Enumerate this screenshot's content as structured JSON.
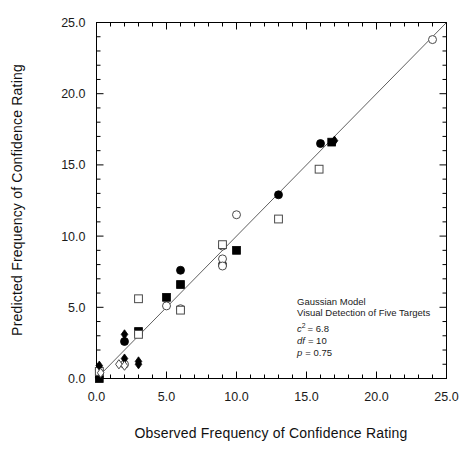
{
  "chart_data": {
    "type": "scatter",
    "title": "",
    "xlabel": "Observed Frequency of Confidence Rating",
    "ylabel": "Predicted Frequency of Confidence Rating",
    "xlim": [
      0,
      25
    ],
    "ylim": [
      0,
      25
    ],
    "xticks": [
      0,
      5,
      10,
      15,
      20,
      25
    ],
    "yticks": [
      0,
      5,
      10,
      15,
      20,
      25
    ],
    "xticklabels": [
      "0.0",
      "5.0",
      "10.0",
      "15.0",
      "20.0",
      "25.0"
    ],
    "yticklabels": [
      "0.0",
      "5.0",
      "10.0",
      "15.0",
      "20.0",
      "25.0"
    ],
    "minor_ticks_per_interval": 5,
    "grid": false,
    "legend": "none",
    "reference_line": {
      "name": "identity-line",
      "type": "line",
      "x": [
        0,
        25
      ],
      "y": [
        0,
        25
      ],
      "color": "#4d4d4d"
    },
    "series": [
      {
        "name": "filled-circle",
        "marker": "circle",
        "fill": "solid",
        "color": "#000000",
        "points": [
          {
            "x": 0.2,
            "y": 0.1
          },
          {
            "x": 2.0,
            "y": 2.6
          },
          {
            "x": 6.0,
            "y": 7.6
          },
          {
            "x": 9.0,
            "y": 8.0
          },
          {
            "x": 13.0,
            "y": 12.9
          },
          {
            "x": 16.0,
            "y": 16.5
          }
        ]
      },
      {
        "name": "open-circle",
        "marker": "circle",
        "fill": "open",
        "color": "#4a4a4a",
        "points": [
          {
            "x": 0.2,
            "y": 0.6
          },
          {
            "x": 2.0,
            "y": 1.0
          },
          {
            "x": 5.0,
            "y": 5.1
          },
          {
            "x": 6.0,
            "y": 4.9
          },
          {
            "x": 9.0,
            "y": 9.3
          },
          {
            "x": 9.0,
            "y": 8.4
          },
          {
            "x": 9.0,
            "y": 7.9
          },
          {
            "x": 10.0,
            "y": 11.5
          },
          {
            "x": 24.0,
            "y": 23.8
          }
        ]
      },
      {
        "name": "filled-square",
        "marker": "square",
        "fill": "solid",
        "color": "#000000",
        "points": [
          {
            "x": 0.2,
            "y": 0.0
          },
          {
            "x": 3.0,
            "y": 3.3
          },
          {
            "x": 5.0,
            "y": 5.7
          },
          {
            "x": 6.0,
            "y": 6.6
          },
          {
            "x": 10.0,
            "y": 9.0
          },
          {
            "x": 16.8,
            "y": 16.6
          }
        ]
      },
      {
        "name": "open-square",
        "marker": "square",
        "fill": "open",
        "color": "#4a4a4a",
        "points": [
          {
            "x": 0.2,
            "y": 0.5
          },
          {
            "x": 3.0,
            "y": 5.6
          },
          {
            "x": 3.0,
            "y": 3.1
          },
          {
            "x": 6.0,
            "y": 4.8
          },
          {
            "x": 9.0,
            "y": 9.4
          },
          {
            "x": 13.0,
            "y": 11.2
          },
          {
            "x": 15.9,
            "y": 14.7
          }
        ]
      },
      {
        "name": "filled-diamond",
        "marker": "diamond",
        "fill": "solid",
        "color": "#000000",
        "points": [
          {
            "x": 0.2,
            "y": 0.9
          },
          {
            "x": 2.0,
            "y": 3.1
          },
          {
            "x": 2.0,
            "y": 1.4
          },
          {
            "x": 3.0,
            "y": 1.2
          },
          {
            "x": 3.0,
            "y": 1.0
          },
          {
            "x": 17.0,
            "y": 16.7
          }
        ]
      },
      {
        "name": "open-diamond",
        "marker": "diamond",
        "fill": "open",
        "color": "#4a4a4a",
        "points": [
          {
            "x": 0.3,
            "y": 0.4
          },
          {
            "x": 1.6,
            "y": 1.0
          },
          {
            "x": 2.0,
            "y": 0.9
          }
        ]
      }
    ],
    "annotations": {
      "model_name": "Gaussian Model",
      "experiment": "Visual Detection of Five Targets",
      "chi_symbol": "c",
      "chi_exponent": "2",
      "chi_value": "= 6.8",
      "df_label": "df",
      "df_value": "= 10",
      "p_label": "p",
      "p_value": "= 0.75"
    }
  }
}
